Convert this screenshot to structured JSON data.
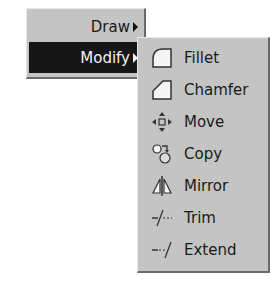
{
  "menu": {
    "items": [
      {
        "label": "Draw",
        "has_submenu": true,
        "selected": false
      },
      {
        "label": "Modify",
        "has_submenu": true,
        "selected": true
      }
    ]
  },
  "submenu": {
    "parent": "Modify",
    "items": [
      {
        "label": "Fillet",
        "icon": "fillet-icon"
      },
      {
        "label": "Chamfer",
        "icon": "chamfer-icon"
      },
      {
        "label": "Move",
        "icon": "move-icon"
      },
      {
        "label": "Copy",
        "icon": "copy-icon"
      },
      {
        "label": "Mirror",
        "icon": "mirror-icon"
      },
      {
        "label": "Trim",
        "icon": "trim-icon"
      },
      {
        "label": "Extend",
        "icon": "extend-icon"
      }
    ]
  },
  "colors": {
    "menu_bg": "#c4c4c4",
    "selected_bg": "#161616",
    "selected_text": "#f2f2f2",
    "text": "#1a1a1a"
  }
}
